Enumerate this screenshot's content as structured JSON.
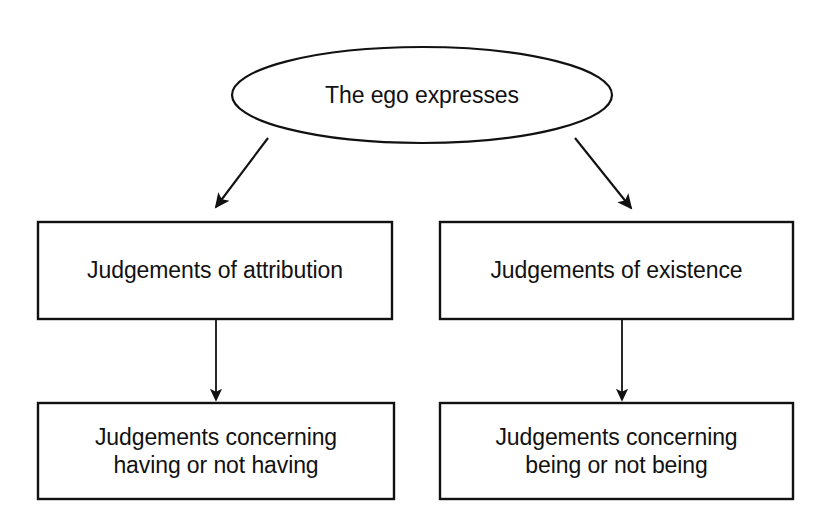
{
  "diagram": {
    "type": "flowchart",
    "title": "The ego expresses",
    "background_color": "#ffffff",
    "stroke_color": "#111111",
    "text_color": "#111111",
    "nodes": [
      {
        "id": "root",
        "shape": "ellipse",
        "label": "The ego expresses",
        "x": 232,
        "y": 47,
        "width": 380,
        "height": 96
      },
      {
        "id": "attribution",
        "shape": "rectangle",
        "label": "Judgements of attribution",
        "x": 38,
        "y": 222,
        "width": 354,
        "height": 97
      },
      {
        "id": "existence",
        "shape": "rectangle",
        "label": "Judgements of existence",
        "x": 440,
        "y": 222,
        "width": 353,
        "height": 97
      },
      {
        "id": "having",
        "shape": "rectangle",
        "label": "Judgements concerning\nhaving or not having",
        "x": 38,
        "y": 403,
        "width": 356,
        "height": 96
      },
      {
        "id": "being",
        "shape": "rectangle",
        "label": "Judgements concerning\nbeing or not being",
        "x": 440,
        "y": 403,
        "width": 353,
        "height": 96
      }
    ],
    "edges": [
      {
        "id": "root-to-attribution",
        "from": "root",
        "to": "attribution",
        "style": "solid",
        "arrowhead": "filled-triangle"
      },
      {
        "id": "root-to-existence",
        "from": "root",
        "to": "existence",
        "style": "solid",
        "arrowhead": "filled-triangle"
      },
      {
        "id": "attribution-to-having",
        "from": "attribution",
        "to": "having",
        "style": "solid",
        "arrowhead": "filled-triangle"
      },
      {
        "id": "existence-to-being",
        "from": "existence",
        "to": "being",
        "style": "solid",
        "arrowhead": "filled-triangle"
      }
    ]
  }
}
